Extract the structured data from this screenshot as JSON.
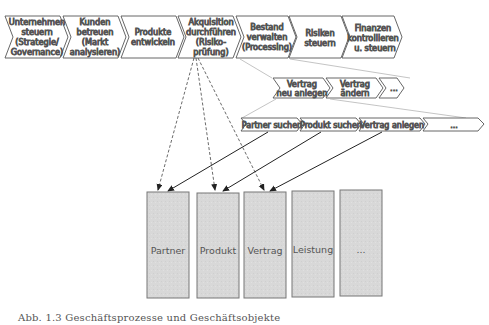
{
  "main_processes": [
    {
      "lines": [
        "Unternehmen",
        "steuern",
        "(Strategie/",
        "Governance)"
      ]
    },
    {
      "lines": [
        "Kunden",
        "betreuen",
        "(Markt",
        "analysieren)"
      ]
    },
    {
      "lines": [
        "Produkte",
        "entwickeln"
      ]
    },
    {
      "lines": [
        "Akquisition",
        "durchführen",
        "(Risiko-",
        "prüfung)"
      ]
    },
    {
      "lines": [
        "Bestand",
        "verwalten",
        "(Processing)"
      ]
    },
    {
      "lines": [
        "Risiken",
        "steuern"
      ]
    },
    {
      "lines": [
        "Finanzen",
        "kontrollieren",
        "u. steuern"
      ]
    }
  ],
  "sub_processes": [
    {
      "lines": [
        "Vertrag",
        "neu anlegen"
      ]
    },
    {
      "lines": [
        "Vertrag",
        "ändern"
      ]
    },
    {
      "lines": [
        "..."
      ]
    }
  ],
  "steps": [
    {
      "label": "Partner suchen"
    },
    {
      "label": "Produkt suchen"
    },
    {
      "label": "Vertrag anlegen"
    },
    {
      "label": "..."
    }
  ],
  "business_objects": [
    {
      "label": "Partner"
    },
    {
      "label": "Produkt"
    },
    {
      "label": "Vertrag"
    },
    {
      "label": "Leistung"
    },
    {
      "label": "..."
    }
  ],
  "caption": "Abb. 1.3 Geschäftsprozesse und Geschäftsobjekte",
  "colors": {
    "stroke": "#555555",
    "box_fill": "#d9d9d9",
    "box_stroke": "#666666",
    "line": "#999999"
  }
}
